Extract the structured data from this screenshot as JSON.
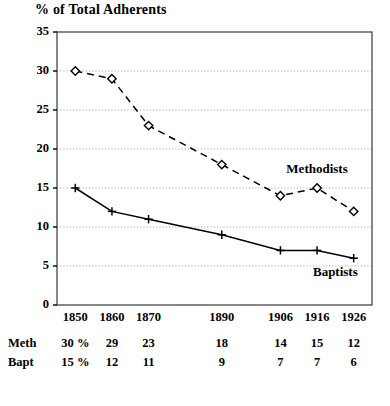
{
  "chart_data": {
    "type": "line",
    "title": "% of Total Adherents",
    "xlabel": "",
    "ylabel": "",
    "ylim": [
      0,
      35
    ],
    "yticks": [
      0,
      5,
      10,
      15,
      20,
      25,
      30,
      35
    ],
    "grid": true,
    "legend_position": "inline-annotation",
    "categories": [
      "1850",
      "1860",
      "1870",
      "1890",
      "1906",
      "1916",
      "1926"
    ],
    "x": [
      1850,
      1860,
      1870,
      1890,
      1906,
      1916,
      1926
    ],
    "series": [
      {
        "name": "Methodists",
        "values": [
          30,
          29,
          23,
          18,
          14,
          15,
          12
        ],
        "line_style": "dashed",
        "marker": "diamond-open",
        "color": "#000000"
      },
      {
        "name": "Baptists",
        "values": [
          15,
          12,
          11,
          9,
          7,
          7,
          6
        ],
        "line_style": "solid",
        "marker": "plus",
        "color": "#000000"
      }
    ],
    "annotations": [
      {
        "text": "Methodists",
        "x": 1916,
        "y": 17.5
      },
      {
        "text": "Baptists",
        "x": 1921,
        "y": 4.2
      }
    ]
  },
  "axis": {
    "ytick_labels": [
      "35",
      "30",
      "25",
      "20",
      "15",
      "10",
      "5",
      "0"
    ],
    "xtick_labels": [
      "1850",
      "1860",
      "1870",
      "1890",
      "1906",
      "1916",
      "1926"
    ]
  },
  "table": {
    "rows": [
      {
        "label": "Meth",
        "cells": [
          "30 %",
          "29",
          "23",
          "18",
          "14",
          "15",
          "12"
        ]
      },
      {
        "label": "Bapt",
        "cells": [
          "15 %",
          "12",
          "11",
          "9",
          "7",
          "7",
          "6"
        ]
      }
    ]
  },
  "colors": {
    "ink": "#000000",
    "grid": "#999999",
    "axis": "#555555",
    "background": "#ffffff"
  }
}
